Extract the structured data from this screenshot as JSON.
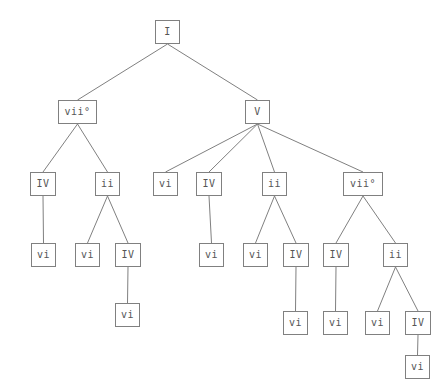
{
  "diagram": {
    "type": "harmonic-analysis-tree",
    "title": "",
    "background_color": "#ffffff",
    "node_border_color": "#808080",
    "node_fill_color": "#ffffff",
    "text_color": "#555555",
    "edge_color": "#808080",
    "node_height": 24,
    "nodes": [
      {
        "id": "n0",
        "label": "I",
        "x": 155,
        "y": 20,
        "w": 25,
        "depth": 0
      },
      {
        "id": "n1",
        "label": "vii°",
        "x": 58,
        "y": 100,
        "w": 39,
        "depth": 1
      },
      {
        "id": "n2",
        "label": "V",
        "x": 245,
        "y": 100,
        "w": 25,
        "depth": 1
      },
      {
        "id": "n3",
        "label": "IV",
        "x": 30,
        "y": 172,
        "w": 26,
        "depth": 2
      },
      {
        "id": "n4",
        "label": "ii",
        "x": 95,
        "y": 172,
        "w": 25,
        "depth": 2
      },
      {
        "id": "n5",
        "label": "vi",
        "x": 153,
        "y": 172,
        "w": 25,
        "depth": 2
      },
      {
        "id": "n6",
        "label": "IV",
        "x": 196,
        "y": 172,
        "w": 26,
        "depth": 2
      },
      {
        "id": "n7",
        "label": "ii",
        "x": 262,
        "y": 172,
        "w": 25,
        "depth": 2
      },
      {
        "id": "n8",
        "label": "vii°",
        "x": 343,
        "y": 172,
        "w": 40,
        "depth": 2
      },
      {
        "id": "n9",
        "label": "vi",
        "x": 31,
        "y": 243,
        "w": 25,
        "depth": 3
      },
      {
        "id": "n10",
        "label": "vi",
        "x": 75,
        "y": 243,
        "w": 25,
        "depth": 3
      },
      {
        "id": "n11",
        "label": "IV",
        "x": 115,
        "y": 243,
        "w": 26,
        "depth": 3
      },
      {
        "id": "n12",
        "label": "vi",
        "x": 199,
        "y": 243,
        "w": 25,
        "depth": 3
      },
      {
        "id": "n13",
        "label": "vi",
        "x": 243,
        "y": 243,
        "w": 25,
        "depth": 3
      },
      {
        "id": "n14",
        "label": "IV",
        "x": 283,
        "y": 243,
        "w": 26,
        "depth": 3
      },
      {
        "id": "n15",
        "label": "IV",
        "x": 323,
        "y": 243,
        "w": 26,
        "depth": 3
      },
      {
        "id": "n16",
        "label": "ii",
        "x": 383,
        "y": 243,
        "w": 25,
        "depth": 3
      },
      {
        "id": "n17",
        "label": "vi",
        "x": 115,
        "y": 303,
        "w": 25,
        "depth": 4
      },
      {
        "id": "n18",
        "label": "vi",
        "x": 283,
        "y": 311,
        "w": 25,
        "depth": 4
      },
      {
        "id": "n19",
        "label": "vi",
        "x": 323,
        "y": 311,
        "w": 25,
        "depth": 4
      },
      {
        "id": "n20",
        "label": "vi",
        "x": 365,
        "y": 311,
        "w": 25,
        "depth": 4
      },
      {
        "id": "n21",
        "label": "IV",
        "x": 405,
        "y": 311,
        "w": 26,
        "depth": 4
      },
      {
        "id": "n22",
        "label": "vi",
        "x": 405,
        "y": 355,
        "w": 25,
        "depth": 5
      }
    ],
    "edges": [
      {
        "from": "n0",
        "to": "n1"
      },
      {
        "from": "n0",
        "to": "n2"
      },
      {
        "from": "n1",
        "to": "n3"
      },
      {
        "from": "n1",
        "to": "n4"
      },
      {
        "from": "n2",
        "to": "n5"
      },
      {
        "from": "n2",
        "to": "n6"
      },
      {
        "from": "n2",
        "to": "n7"
      },
      {
        "from": "n2",
        "to": "n8"
      },
      {
        "from": "n3",
        "to": "n9"
      },
      {
        "from": "n4",
        "to": "n10"
      },
      {
        "from": "n4",
        "to": "n11"
      },
      {
        "from": "n6",
        "to": "n12"
      },
      {
        "from": "n7",
        "to": "n13"
      },
      {
        "from": "n7",
        "to": "n14"
      },
      {
        "from": "n8",
        "to": "n15"
      },
      {
        "from": "n8",
        "to": "n16"
      },
      {
        "from": "n11",
        "to": "n17"
      },
      {
        "from": "n14",
        "to": "n18"
      },
      {
        "from": "n15",
        "to": "n19"
      },
      {
        "from": "n16",
        "to": "n20"
      },
      {
        "from": "n16",
        "to": "n21"
      },
      {
        "from": "n21",
        "to": "n22"
      }
    ]
  }
}
